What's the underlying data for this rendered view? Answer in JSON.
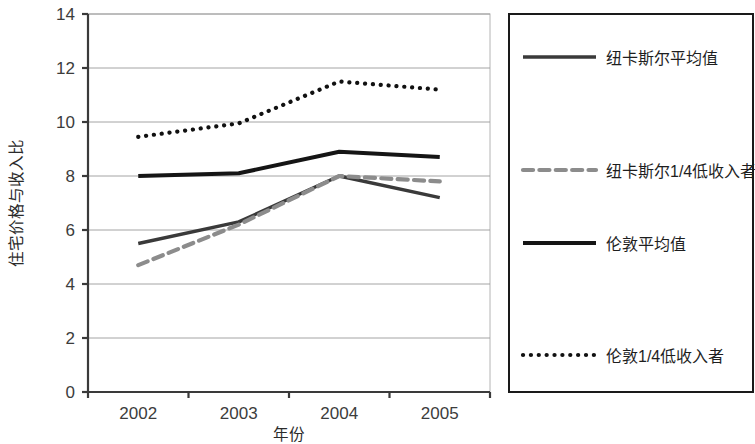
{
  "chart_data": {
    "type": "line",
    "title": "",
    "xlabel": "年份",
    "ylabel": "住宅价格与收入比",
    "categories": [
      "2002",
      "2003",
      "2004",
      "2005"
    ],
    "ylim": [
      0,
      14
    ],
    "yticks": [
      0,
      2,
      4,
      6,
      8,
      10,
      12,
      14
    ],
    "ytick_labels": [
      "0",
      "2",
      "4",
      "6",
      "8",
      "10",
      "12",
      "14"
    ],
    "grid": true,
    "legend_position": "right",
    "series": [
      {
        "name": "纽卡斯尔平均值",
        "values": [
          5.5,
          6.3,
          8.0,
          7.2
        ],
        "style": "solid",
        "color": "#3a3a3a",
        "width": 3.4
      },
      {
        "name": "纽卡斯尔1/4低收入者",
        "values": [
          4.7,
          6.2,
          8.0,
          7.8
        ],
        "style": "dashed",
        "color": "#8c8c8c",
        "width": 4.2
      },
      {
        "name": "伦敦平均值",
        "values": [
          8.0,
          8.1,
          8.9,
          8.7
        ],
        "style": "solid",
        "color": "#151515",
        "width": 4.0
      },
      {
        "name": "伦敦1/4低收入者",
        "values": [
          9.45,
          9.95,
          11.5,
          11.2
        ],
        "style": "dotted",
        "color": "#111111",
        "width": 4.2
      }
    ]
  },
  "legend": {
    "items": [
      {
        "label": "纽卡斯尔平均值",
        "style": "solid",
        "color": "#3a3a3a"
      },
      {
        "label": "纽卡斯尔1/4低收入者",
        "style": "dashed",
        "color": "#8c8c8c"
      },
      {
        "label": "伦敦平均值",
        "style": "solid",
        "color": "#151515"
      },
      {
        "label": "伦敦1/4低收入者",
        "style": "dotted",
        "color": "#111111"
      }
    ]
  },
  "axes": {
    "y_title": "住宅价格与收入比",
    "x_title": "年份",
    "y_labels": [
      "14",
      "12",
      "10",
      "8",
      "6",
      "4",
      "2",
      "0"
    ],
    "x_labels": [
      "2002",
      "2003",
      "2004",
      "2005"
    ]
  },
  "colors": {
    "grid": "#9a9a9a",
    "axis": "#3a3a3a",
    "legend_border": "#1a1a1a",
    "plot_border": "#b4b4b4",
    "background": "#ffffff"
  }
}
